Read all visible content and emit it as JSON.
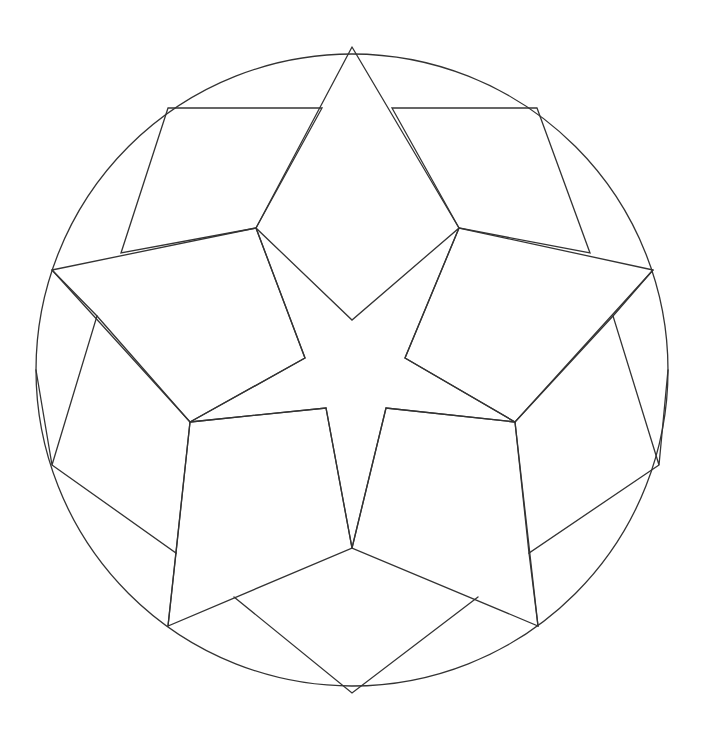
{
  "figure": {
    "type": "mandala-line-art",
    "stroke_color": "#333333",
    "background_color": "#ffffff",
    "circle": {
      "cx": 352,
      "cy": 370,
      "r": 316
    },
    "polylines": [
      {
        "name": "top-rhombus",
        "points": "352,47 256,228 352,320 459,228 352,47"
      },
      {
        "name": "upper-left-quad",
        "points": "168,108 322,108 256,228 121,253 168,108"
      },
      {
        "name": "upper-right-quad",
        "points": "537,108 392,108 459,228 590,253 537,108"
      },
      {
        "name": "left-kite",
        "points": "52,270 256,228 305,358 190,422 52,270"
      },
      {
        "name": "right-kite",
        "points": "653,270 459,228 405,358 515,422 653,270"
      },
      {
        "name": "left-side-quad",
        "points": "52,270 97,316 52,465 36,370"
      },
      {
        "name": "left-lower-quad",
        "points": "97,316 190,422 176,553 52,465"
      },
      {
        "name": "right-side-quad",
        "points": "653,270 613,316 659,465 668,370"
      },
      {
        "name": "right-lower-quad",
        "points": "613,316 515,422 529,553 659,465"
      },
      {
        "name": "bottom-left-quad",
        "points": "190,422 326,408 352,548 168,626 190,422"
      },
      {
        "name": "bottom-right-quad",
        "points": "515,422 386,408 352,548 538,626 515,422"
      },
      {
        "name": "bottom-rhombus",
        "points": "234,597 352,693 478,597"
      },
      {
        "name": "star-inner-left",
        "points": "256,228 305,358 190,422"
      },
      {
        "name": "star-inner-right",
        "points": "459,228 405,358 515,422"
      },
      {
        "name": "star-notch-lower",
        "points": "190,422 326,408 352,548 386,408 515,422"
      },
      {
        "name": "bottom-left-edge",
        "points": "168,626 176,553"
      },
      {
        "name": "bottom-right-edge",
        "points": "538,626 529,553"
      }
    ]
  }
}
